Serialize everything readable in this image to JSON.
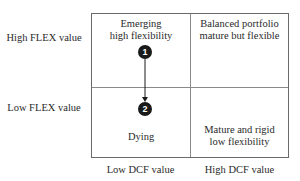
{
  "rows": [
    {
      "label": "High FLEX value"
    },
    {
      "label": "Low FLEX value"
    }
  ],
  "columns": [
    {
      "label": "Low DCF value"
    },
    {
      "label": "High DCF value"
    }
  ],
  "cells": {
    "top_left": {
      "line1": "Emerging",
      "line2": "high flexibility"
    },
    "top_right": {
      "line1": "Balanced portfolio",
      "line2": "mature but flexible"
    },
    "bottom_left": {
      "line1": "Dying"
    },
    "bottom_right": {
      "line1": "Mature and rigid",
      "line2": "low flexibility"
    }
  },
  "markers": [
    {
      "id": "1",
      "label": "1",
      "quadrant": "top_left"
    },
    {
      "id": "2",
      "label": "2",
      "quadrant": "bottom_left"
    }
  ],
  "arrow": {
    "from": "1",
    "to": "2",
    "direction": "down"
  },
  "colors": {
    "marker_fill": "#1a1a1a",
    "marker_text": "#ffffff",
    "grid_line": "#6a6a6a",
    "text": "#2a2a2a"
  }
}
